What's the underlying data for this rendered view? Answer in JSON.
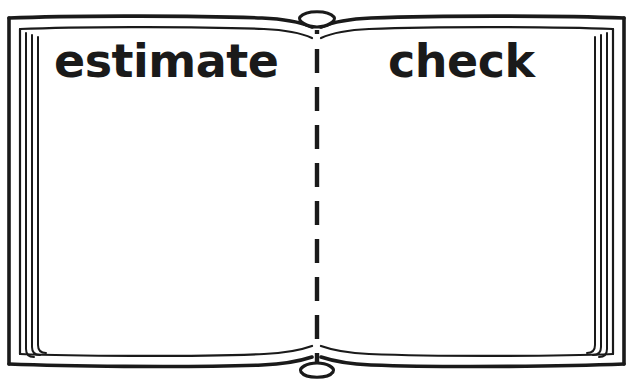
{
  "worksheet": {
    "title": "estimate and check open book worksheet",
    "background_color": "#ffffff",
    "ink_color": "#1a1a1a"
  },
  "book": {
    "name": "open-book-outline",
    "left_page": {
      "label": "estimate",
      "content": ""
    },
    "right_page": {
      "label": "check",
      "content": ""
    },
    "spine": {
      "style": "dashed",
      "orientation": "vertical",
      "center_x": 317,
      "top_y": 28,
      "bottom_y": 364,
      "dash_length": 22,
      "gap_length": 14
    },
    "page_edge_lines": {
      "left_count": 3,
      "right_count": 3
    },
    "binding_nubs": {
      "top": "lens-shape",
      "bottom": "lens-shape"
    }
  },
  "labels": {
    "left": "estimate",
    "right": "check"
  }
}
